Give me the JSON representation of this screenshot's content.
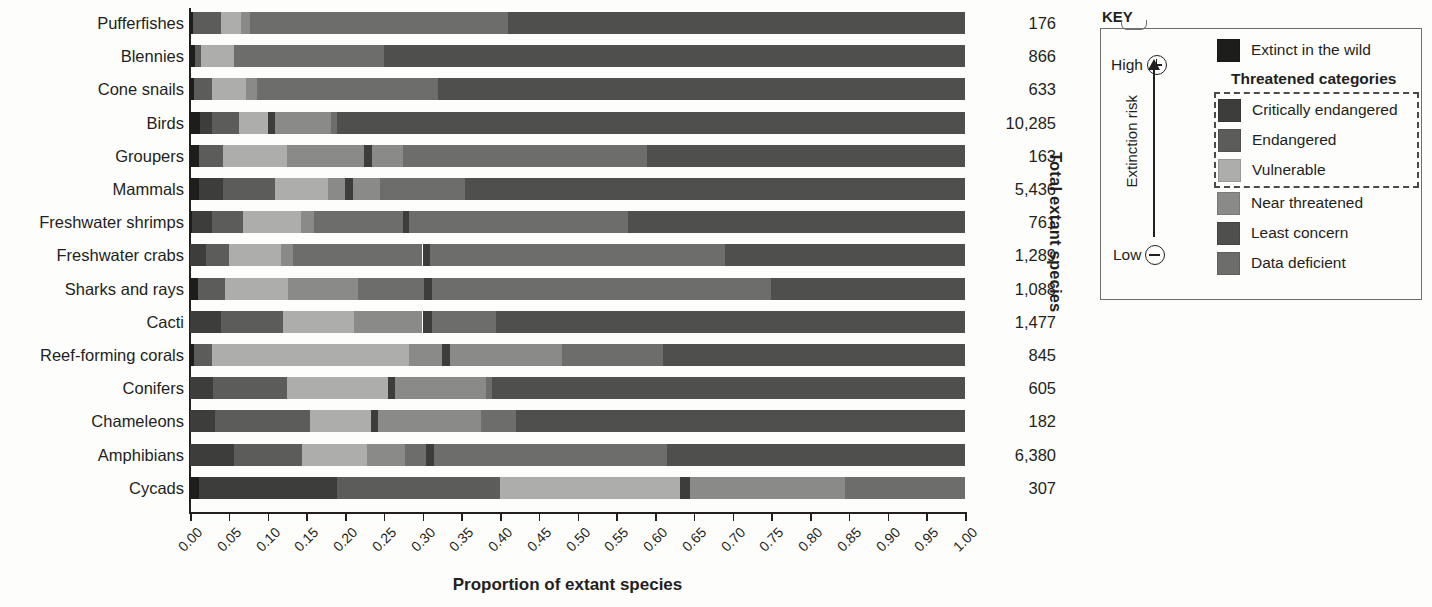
{
  "chart_data": {
    "type": "bar",
    "subtype": "stacked-horizontal-100pct",
    "title": "",
    "xlabel": "Proportion of extant species",
    "ylabel": "",
    "right_axis_label": "Total extant species",
    "xlim": [
      0,
      1
    ],
    "grid": false,
    "legend_position": "right",
    "tick_labels": [
      "0.00",
      "0.05",
      "0.10",
      "0.15",
      "0.20",
      "0.25",
      "0.30",
      "0.35",
      "0.40",
      "0.45",
      "0.50",
      "0.55",
      "0.60",
      "0.65",
      "0.70",
      "0.75",
      "0.80",
      "0.85",
      "0.90",
      "0.95",
      "1.00"
    ],
    "tick_values": [
      0,
      0.05,
      0.1,
      0.15,
      0.2,
      0.25,
      0.3,
      0.35,
      0.4,
      0.45,
      0.5,
      0.55,
      0.6,
      0.65,
      0.7,
      0.75,
      0.8,
      0.85,
      0.9,
      0.95,
      1.0
    ],
    "series": [
      {
        "name": "Extinct in the wild",
        "color": "#1d1d1b"
      },
      {
        "name": "Critically endangered",
        "color": "#3d3d3c"
      },
      {
        "name": "Endangered",
        "color": "#5c5c5b"
      },
      {
        "name": "Vulnerable",
        "color": "#adadab"
      },
      {
        "name": "Near threatened",
        "color": "#8a8a88"
      },
      {
        "name": "Least concern",
        "color": "#4f4f4e"
      },
      {
        "name": "Data deficient",
        "color": "#6d6d6c"
      }
    ],
    "categories": [
      "Pufferfishes",
      "Blennies",
      "Cone snails",
      "Birds",
      "Groupers",
      "Mammals",
      "Freshwater shrimps",
      "Freshwater crabs",
      "Sharks and rays",
      "Cacti",
      "Reef-forming corals",
      "Conifers",
      "Chameleons",
      "Amphibians",
      "Cycads"
    ],
    "totals": [
      "176",
      "866",
      "633",
      "10,285",
      "163",
      "5,436",
      "761",
      "1,289",
      "1,088",
      "1,477",
      "845",
      "605",
      "182",
      "6,380",
      "307"
    ],
    "rows": [
      {
        "category": "Pufferfishes",
        "total": "176",
        "values": {
          "ew": 0.004,
          "cr": 0.0,
          "en": 0.034,
          "vu": 0.034,
          "nt": 0.017,
          "ld": 0.0,
          "lc": 0.0,
          "dd": 0.0
        },
        "segments": [
          {
            "cat": "ew",
            "start": 0.0,
            "end": 0.004
          },
          {
            "cat": "en",
            "start": 0.004,
            "end": 0.04
          },
          {
            "cat": "vu",
            "start": 0.04,
            "end": 0.066
          },
          {
            "cat": "nt",
            "start": 0.066,
            "end": 0.078
          },
          {
            "cat": "dd",
            "start": 0.078,
            "end": 0.41
          },
          {
            "cat": "lc",
            "start": 0.41,
            "end": 1.0
          }
        ]
      },
      {
        "category": "Blennies",
        "total": "866",
        "segments": [
          {
            "cat": "ew",
            "start": 0.0,
            "end": 0.006
          },
          {
            "cat": "en",
            "start": 0.006,
            "end": 0.014
          },
          {
            "cat": "vu",
            "start": 0.014,
            "end": 0.057
          },
          {
            "cat": "dd",
            "start": 0.057,
            "end": 0.25
          },
          {
            "cat": "lc",
            "start": 0.25,
            "end": 1.0
          }
        ]
      },
      {
        "category": "Cone snails",
        "total": "633",
        "segments": [
          {
            "cat": "ew",
            "start": 0.0,
            "end": 0.005
          },
          {
            "cat": "en",
            "start": 0.005,
            "end": 0.028
          },
          {
            "cat": "vu",
            "start": 0.028,
            "end": 0.072
          },
          {
            "cat": "nt",
            "start": 0.072,
            "end": 0.086
          },
          {
            "cat": "dd",
            "start": 0.086,
            "end": 0.32
          },
          {
            "cat": "lc",
            "start": 0.32,
            "end": 1.0
          }
        ]
      },
      {
        "category": "Birds",
        "total": "10,285",
        "segments": [
          {
            "cat": "ew",
            "start": 0.0,
            "end": 0.013
          },
          {
            "cat": "cr",
            "start": 0.013,
            "end": 0.029
          },
          {
            "cat": "en",
            "start": 0.029,
            "end": 0.063
          },
          {
            "cat": "vu",
            "start": 0.063,
            "end": 0.101
          },
          {
            "cat": "cr",
            "start": 0.101,
            "end": 0.11
          },
          {
            "cat": "nt",
            "start": 0.11,
            "end": 0.182
          },
          {
            "cat": "dd",
            "start": 0.182,
            "end": 0.19
          },
          {
            "cat": "lc",
            "start": 0.19,
            "end": 1.0
          }
        ]
      },
      {
        "category": "Groupers",
        "total": "163",
        "segments": [
          {
            "cat": "ew",
            "start": 0.0,
            "end": 0.011
          },
          {
            "cat": "en",
            "start": 0.011,
            "end": 0.043
          },
          {
            "cat": "vu",
            "start": 0.043,
            "end": 0.125
          },
          {
            "cat": "nt",
            "start": 0.125,
            "end": 0.225
          },
          {
            "cat": "cr",
            "start": 0.225,
            "end": 0.235
          },
          {
            "cat": "nt",
            "start": 0.235,
            "end": 0.275
          },
          {
            "cat": "dd",
            "start": 0.275,
            "end": 0.59
          },
          {
            "cat": "lc",
            "start": 0.59,
            "end": 1.0
          }
        ]
      },
      {
        "category": "Mammals",
        "total": "5,436",
        "segments": [
          {
            "cat": "ew",
            "start": 0.0,
            "end": 0.012
          },
          {
            "cat": "cr",
            "start": 0.012,
            "end": 0.043
          },
          {
            "cat": "en",
            "start": 0.043,
            "end": 0.11
          },
          {
            "cat": "vu",
            "start": 0.11,
            "end": 0.178
          },
          {
            "cat": "nt",
            "start": 0.178,
            "end": 0.2
          },
          {
            "cat": "cr",
            "start": 0.2,
            "end": 0.21
          },
          {
            "cat": "nt",
            "start": 0.21,
            "end": 0.245
          },
          {
            "cat": "dd",
            "start": 0.245,
            "end": 0.355
          },
          {
            "cat": "lc",
            "start": 0.355,
            "end": 1.0
          }
        ]
      },
      {
        "category": "Freshwater shrimps",
        "total": "761",
        "segments": [
          {
            "cat": "ew",
            "start": 0.0,
            "end": 0.003
          },
          {
            "cat": "cr",
            "start": 0.003,
            "end": 0.028
          },
          {
            "cat": "en",
            "start": 0.028,
            "end": 0.068
          },
          {
            "cat": "vu",
            "start": 0.068,
            "end": 0.143
          },
          {
            "cat": "nt",
            "start": 0.143,
            "end": 0.16
          },
          {
            "cat": "dd",
            "start": 0.16,
            "end": 0.275
          },
          {
            "cat": "cr",
            "start": 0.275,
            "end": 0.283
          },
          {
            "cat": "dd",
            "start": 0.283,
            "end": 0.565
          },
          {
            "cat": "lc",
            "start": 0.565,
            "end": 1.0
          }
        ]
      },
      {
        "category": "Freshwater crabs",
        "total": "1,289",
        "segments": [
          {
            "cat": "cr",
            "start": 0.0,
            "end": 0.021
          },
          {
            "cat": "en",
            "start": 0.021,
            "end": 0.05
          },
          {
            "cat": "vu",
            "start": 0.05,
            "end": 0.118
          },
          {
            "cat": "nt",
            "start": 0.118,
            "end": 0.133
          },
          {
            "cat": "dd",
            "start": 0.133,
            "end": 0.3
          },
          {
            "cat": "cr",
            "start": 0.3,
            "end": 0.31
          },
          {
            "cat": "dd",
            "start": 0.31,
            "end": 0.69
          },
          {
            "cat": "lc",
            "start": 0.69,
            "end": 1.0
          }
        ]
      },
      {
        "category": "Sharks and rays",
        "total": "1,088",
        "segments": [
          {
            "cat": "ew",
            "start": 0.0,
            "end": 0.01
          },
          {
            "cat": "en",
            "start": 0.01,
            "end": 0.045
          },
          {
            "cat": "vu",
            "start": 0.045,
            "end": 0.127
          },
          {
            "cat": "nt",
            "start": 0.127,
            "end": 0.217
          },
          {
            "cat": "dd",
            "start": 0.217,
            "end": 0.302
          },
          {
            "cat": "cr",
            "start": 0.302,
            "end": 0.312
          },
          {
            "cat": "dd",
            "start": 0.312,
            "end": 0.75
          },
          {
            "cat": "lc",
            "start": 0.75,
            "end": 1.0
          }
        ]
      },
      {
        "category": "Cacti",
        "total": "1,477",
        "segments": [
          {
            "cat": "cr",
            "start": 0.0,
            "end": 0.04
          },
          {
            "cat": "en",
            "start": 0.04,
            "end": 0.12
          },
          {
            "cat": "vu",
            "start": 0.12,
            "end": 0.212
          },
          {
            "cat": "nt",
            "start": 0.212,
            "end": 0.3
          },
          {
            "cat": "cr",
            "start": 0.3,
            "end": 0.312
          },
          {
            "cat": "dd",
            "start": 0.312,
            "end": 0.395
          },
          {
            "cat": "lc",
            "start": 0.395,
            "end": 1.0
          }
        ]
      },
      {
        "category": "Reef-forming corals",
        "total": "845",
        "segments": [
          {
            "cat": "ew",
            "start": 0.0,
            "end": 0.005
          },
          {
            "cat": "en",
            "start": 0.005,
            "end": 0.028
          },
          {
            "cat": "vu",
            "start": 0.028,
            "end": 0.283
          },
          {
            "cat": "nt",
            "start": 0.283,
            "end": 0.325
          },
          {
            "cat": "cr",
            "start": 0.325,
            "end": 0.335
          },
          {
            "cat": "nt",
            "start": 0.335,
            "end": 0.48
          },
          {
            "cat": "dd",
            "start": 0.48,
            "end": 0.61
          },
          {
            "cat": "lc",
            "start": 0.61,
            "end": 1.0
          }
        ]
      },
      {
        "category": "Conifers",
        "total": "605",
        "segments": [
          {
            "cat": "cr",
            "start": 0.0,
            "end": 0.03
          },
          {
            "cat": "en",
            "start": 0.03,
            "end": 0.125
          },
          {
            "cat": "vu",
            "start": 0.125,
            "end": 0.255
          },
          {
            "cat": "cr",
            "start": 0.255,
            "end": 0.265
          },
          {
            "cat": "nt",
            "start": 0.265,
            "end": 0.382
          },
          {
            "cat": "dd",
            "start": 0.382,
            "end": 0.39
          },
          {
            "cat": "lc",
            "start": 0.39,
            "end": 1.0
          }
        ]
      },
      {
        "category": "Chameleons",
        "total": "182",
        "segments": [
          {
            "cat": "cr",
            "start": 0.0,
            "end": 0.032
          },
          {
            "cat": "en",
            "start": 0.032,
            "end": 0.155
          },
          {
            "cat": "vu",
            "start": 0.155,
            "end": 0.233
          },
          {
            "cat": "cr",
            "start": 0.233,
            "end": 0.243
          },
          {
            "cat": "nt",
            "start": 0.243,
            "end": 0.375
          },
          {
            "cat": "dd",
            "start": 0.375,
            "end": 0.42
          },
          {
            "cat": "lc",
            "start": 0.42,
            "end": 1.0
          }
        ]
      },
      {
        "category": "Amphibians",
        "total": "6,380",
        "segments": [
          {
            "cat": "cr",
            "start": 0.0,
            "end": 0.057
          },
          {
            "cat": "en",
            "start": 0.057,
            "end": 0.145
          },
          {
            "cat": "vu",
            "start": 0.145,
            "end": 0.228
          },
          {
            "cat": "nt",
            "start": 0.228,
            "end": 0.278
          },
          {
            "cat": "dd",
            "start": 0.278,
            "end": 0.305
          },
          {
            "cat": "cr",
            "start": 0.305,
            "end": 0.315
          },
          {
            "cat": "dd",
            "start": 0.315,
            "end": 0.615
          },
          {
            "cat": "lc",
            "start": 0.615,
            "end": 1.0
          }
        ]
      },
      {
        "category": "Cycads",
        "total": "307",
        "segments": [
          {
            "cat": "ew",
            "start": 0.0,
            "end": 0.012
          },
          {
            "cat": "cr",
            "start": 0.012,
            "end": 0.19
          },
          {
            "cat": "en",
            "start": 0.19,
            "end": 0.4
          },
          {
            "cat": "vu",
            "start": 0.4,
            "end": 0.632
          },
          {
            "cat": "cr",
            "start": 0.632,
            "end": 0.645
          },
          {
            "cat": "nt",
            "start": 0.645,
            "end": 0.845
          },
          {
            "cat": "dd",
            "start": 0.845,
            "end": 1.0
          }
        ]
      }
    ]
  },
  "key": {
    "title": "KEY",
    "risk_high": "High",
    "risk_low": "Low",
    "risk_axis_label": "Extinction risk",
    "threatened_header": "Threatened categories",
    "items_top": [
      {
        "label": "Extinct in the wild",
        "color": "#1d1d1b"
      }
    ],
    "items_threatened": [
      {
        "label": "Critically endangered",
        "color": "#3d3d3c"
      },
      {
        "label": "Endangered",
        "color": "#5c5c5b"
      },
      {
        "label": "Vulnerable",
        "color": "#adadab"
      }
    ],
    "items_bottom": [
      {
        "label": "Near threatened",
        "color": "#8a8a88"
      },
      {
        "label": "Least concern",
        "color": "#4f4f4e"
      },
      {
        "label": "Data deficient",
        "color": "#6d6d6c"
      }
    ]
  },
  "colors": {
    "ew": "#1d1d1b",
    "cr": "#3d3d3c",
    "en": "#5c5c5b",
    "vu": "#adadab",
    "nt": "#8a8a88",
    "lc": "#4f4f4e",
    "dd": "#6d6d6c",
    "ink": "#231f20"
  }
}
